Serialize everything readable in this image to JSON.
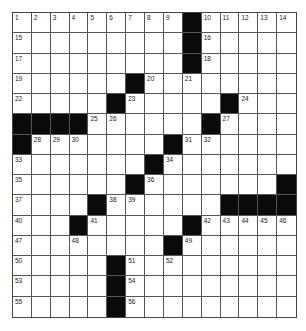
{
  "puzzle": {
    "rows": 15,
    "cols": 15,
    "layout": [
      "OOOOOOOOO#OOOOO",
      "OOOOOOOOO#OOOOO",
      "OOOOOOOOO#OOOOO",
      "OOOOOO#OOOOOOOO",
      "OOOOO#OOOOO#OOO",
      "####OOOOOO#OOOO",
      "#OOOOOOO#OOOOOO",
      "OOOOOOO#OOOOOOO",
      "OOOOOO#OOOOOOO#",
      "OOOO#OOOOOO####",
      "OOO#OOOOO#OOOOO",
      "OOOOOOOO#OOOOOO",
      "OOOOO#OOOOOOOOO",
      "OOOOO#OOOOOOOOO",
      "OOOOO#OOOOOOOOO"
    ],
    "numbers": [
      {
        "r": 0,
        "c": 0,
        "n": "1"
      },
      {
        "r": 0,
        "c": 1,
        "n": "2"
      },
      {
        "r": 0,
        "c": 2,
        "n": "3"
      },
      {
        "r": 0,
        "c": 3,
        "n": "4"
      },
      {
        "r": 0,
        "c": 4,
        "n": "5"
      },
      {
        "r": 0,
        "c": 5,
        "n": "6"
      },
      {
        "r": 0,
        "c": 6,
        "n": "7"
      },
      {
        "r": 0,
        "c": 7,
        "n": "8"
      },
      {
        "r": 0,
        "c": 8,
        "n": "9"
      },
      {
        "r": 0,
        "c": 10,
        "n": "10"
      },
      {
        "r": 0,
        "c": 11,
        "n": "11"
      },
      {
        "r": 0,
        "c": 12,
        "n": "12"
      },
      {
        "r": 0,
        "c": 13,
        "n": "13"
      },
      {
        "r": 0,
        "c": 14,
        "n": "14"
      },
      {
        "r": 1,
        "c": 0,
        "n": "15"
      },
      {
        "r": 1,
        "c": 10,
        "n": "16"
      },
      {
        "r": 2,
        "c": 0,
        "n": "17"
      },
      {
        "r": 2,
        "c": 10,
        "n": "18"
      },
      {
        "r": 3,
        "c": 0,
        "n": "19"
      },
      {
        "r": 3,
        "c": 7,
        "n": "20"
      },
      {
        "r": 3,
        "c": 9,
        "n": "21"
      },
      {
        "r": 4,
        "c": 0,
        "n": "22"
      },
      {
        "r": 4,
        "c": 6,
        "n": "23"
      },
      {
        "r": 4,
        "c": 12,
        "n": "24"
      },
      {
        "r": 5,
        "c": 4,
        "n": "25"
      },
      {
        "r": 5,
        "c": 5,
        "n": "26"
      },
      {
        "r": 5,
        "c": 11,
        "n": "27"
      },
      {
        "r": 6,
        "c": 1,
        "n": "28"
      },
      {
        "r": 6,
        "c": 2,
        "n": "29"
      },
      {
        "r": 6,
        "c": 3,
        "n": "30"
      },
      {
        "r": 6,
        "c": 9,
        "n": "31"
      },
      {
        "r": 6,
        "c": 10,
        "n": "32"
      },
      {
        "r": 7,
        "c": 0,
        "n": "33"
      },
      {
        "r": 7,
        "c": 8,
        "n": "34"
      },
      {
        "r": 8,
        "c": 0,
        "n": "35"
      },
      {
        "r": 8,
        "c": 7,
        "n": "36"
      },
      {
        "r": 9,
        "c": 0,
        "n": "37"
      },
      {
        "r": 9,
        "c": 5,
        "n": "38"
      },
      {
        "r": 9,
        "c": 6,
        "n": "39"
      },
      {
        "r": 10,
        "c": 0,
        "n": "40"
      },
      {
        "r": 10,
        "c": 4,
        "n": "41"
      },
      {
        "r": 10,
        "c": 10,
        "n": "42"
      },
      {
        "r": 10,
        "c": 11,
        "n": "43"
      },
      {
        "r": 10,
        "c": 12,
        "n": "44"
      },
      {
        "r": 10,
        "c": 13,
        "n": "45"
      },
      {
        "r": 10,
        "c": 14,
        "n": "46"
      },
      {
        "r": 11,
        "c": 0,
        "n": "47"
      },
      {
        "r": 11,
        "c": 3,
        "n": "48"
      },
      {
        "r": 11,
        "c": 9,
        "n": "49"
      },
      {
        "r": 12,
        "c": 0,
        "n": "50"
      },
      {
        "r": 12,
        "c": 6,
        "n": "51"
      },
      {
        "r": 12,
        "c": 8,
        "n": "52"
      },
      {
        "r": 13,
        "c": 0,
        "n": "53"
      },
      {
        "r": 13,
        "c": 6,
        "n": "54"
      },
      {
        "r": 14,
        "c": 0,
        "n": "55"
      },
      {
        "r": 14,
        "c": 6,
        "n": "56"
      }
    ],
    "colors": {
      "block": "#0a0a0a",
      "open": "#ffffff",
      "grid_line": "#555555",
      "number_text": "#222222"
    }
  }
}
